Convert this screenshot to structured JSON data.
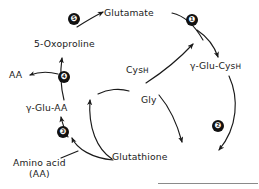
{
  "figure": {
    "background_color": "#ffffff",
    "ink_color": "#1a1a1a",
    "badge_fill": "#111111",
    "badge_text_color": "#ffffff"
  },
  "nodes": {
    "glutamate": {
      "label": "Glutamate"
    },
    "gamma_glu_cysh": {
      "prefix": "γ-Glu-Cys",
      "suffix": "H"
    },
    "glutathione": {
      "label": "Glutathione"
    },
    "gamma_glu_aa": {
      "label": "γ-Glu-AA"
    },
    "oxoproline": {
      "label": "5-Oxoproline"
    },
    "aa": {
      "label": "AA"
    },
    "amino_acid": {
      "line1": "Amino acid",
      "line2": "(AA)"
    },
    "cysh": {
      "prefix": "Cys",
      "suffix": "H"
    },
    "gly": {
      "label": "Gly"
    }
  },
  "steps": [
    {
      "id": "step-1",
      "number": "❶"
    },
    {
      "id": "step-2",
      "number": "❷"
    },
    {
      "id": "step-3",
      "number": "❸"
    },
    {
      "id": "step-4",
      "number": "❹"
    },
    {
      "id": "step-5",
      "number": "❺"
    }
  ]
}
